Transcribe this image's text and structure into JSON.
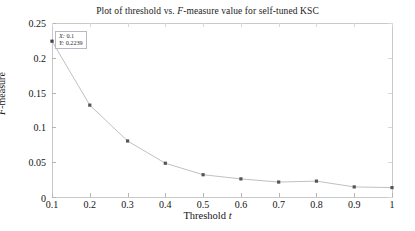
{
  "chart_data": {
    "type": "line",
    "title": "Plot of threshold vs. F-measure value for self-tuned KSC",
    "title_parts": {
      "before": "Plot of threshold vs. ",
      "italic": "F",
      "after": "-measure value for self-tuned KSC"
    },
    "xlabel": "Threshold t",
    "xlabel_parts": {
      "text": "Threshold ",
      "italic": "t"
    },
    "ylabel": "F-measure",
    "ylabel_parts": {
      "italic": "F",
      "text": "-measure"
    },
    "x": [
      0.1,
      0.2,
      0.3,
      0.4,
      0.5,
      0.6,
      0.7,
      0.8,
      0.9,
      1.0
    ],
    "values": [
      0.2239,
      0.132,
      0.0805,
      0.0485,
      0.032,
      0.026,
      0.0215,
      0.0228,
      0.0145,
      0.0135
    ],
    "xlim": [
      0.1,
      1.0
    ],
    "ylim": [
      0,
      0.25
    ],
    "xticks": [
      "0.1",
      "0.2",
      "0.3",
      "0.4",
      "0.5",
      "0.6",
      "0.7",
      "0.8",
      "0.9",
      "1"
    ],
    "xtick_values": [
      0.1,
      0.2,
      0.3,
      0.4,
      0.5,
      0.6,
      0.7,
      0.8,
      0.9,
      1.0
    ],
    "yticks": [
      "0",
      "0.05",
      "0.1",
      "0.15",
      "0.2",
      "0.25"
    ],
    "ytick_values": [
      0,
      0.05,
      0.1,
      0.15,
      0.2,
      0.25
    ],
    "grid": false,
    "legend": null,
    "line_color": "#b9b9b9",
    "marker_color": "#555555",
    "axis_color": "#c9c9c9",
    "annotations": [
      {
        "name": "data-tip",
        "x_label": "X: 0.1",
        "y_label": "Y: 0.2239",
        "x_key": "X:",
        "x_value": "0.1",
        "y_key": "Y:",
        "y_value": "0.2239",
        "point_x": 0.1,
        "point_y": 0.2239
      }
    ]
  }
}
